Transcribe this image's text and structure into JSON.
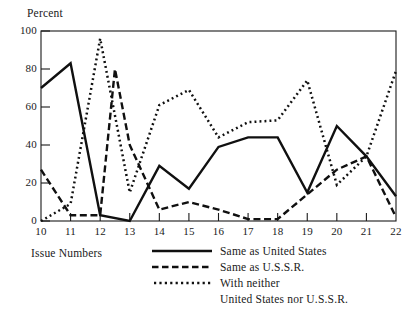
{
  "chart_data": {
    "type": "line",
    "title": "",
    "subtitle": "",
    "xlabel": "Issue Numbers",
    "ylabel": "Percent",
    "xlim": [
      10,
      22
    ],
    "ylim": [
      0,
      100
    ],
    "grid": false,
    "legend_position": "bottom",
    "x_tick_labels": [
      "10",
      "11",
      "12",
      "13",
      "14",
      "15",
      "16",
      "17",
      "18",
      "19",
      "20",
      "21",
      "22"
    ],
    "y_tick_labels": [
      "0",
      "20",
      "40",
      "60",
      "80",
      "100"
    ],
    "x": [
      10,
      11,
      12,
      13,
      14,
      15,
      16,
      17,
      18,
      19,
      20,
      21,
      22
    ],
    "series": [
      {
        "name": "Same as United States",
        "style": "solid",
        "color": "#101010",
        "x": [
          10,
          11,
          12,
          13,
          14,
          15,
          16,
          17,
          18,
          19,
          20,
          21,
          22
        ],
        "values": [
          70,
          83,
          3,
          0,
          29,
          17,
          39,
          44,
          44,
          15,
          50,
          34,
          13
        ]
      },
      {
        "name": "Same as U.S.S.R.",
        "style": "dashed",
        "color": "#101010",
        "x": [
          10,
          11,
          12,
          12.5,
          13,
          14,
          15,
          16,
          17,
          18,
          19,
          20,
          21,
          22
        ],
        "values": [
          27,
          3,
          3,
          80,
          40,
          6,
          10,
          6,
          1,
          1,
          14,
          27,
          34,
          2
        ]
      },
      {
        "name": "With neither United States nor U.S.S.R.",
        "style": "dotted",
        "color": "#101010",
        "x": [
          10,
          11,
          12,
          13,
          14,
          15,
          16,
          17,
          18,
          19,
          20,
          21,
          22
        ],
        "values": [
          0,
          9,
          96,
          15,
          61,
          69,
          44,
          52,
          53,
          74,
          19,
          34,
          79
        ]
      }
    ],
    "legend_entries": [
      {
        "label": "Same as United States",
        "style": "solid"
      },
      {
        "label": "Same as U.S.S.R.",
        "style": "dashed"
      },
      {
        "label": "With neither",
        "style": "dotted"
      },
      {
        "label": "United States nor U.S.S.R.",
        "style": "none"
      }
    ]
  },
  "axes": {
    "y_title": "Percent",
    "x_title": "Issue Numbers",
    "y_ticks": [
      "100",
      "80",
      "60",
      "40",
      "20",
      "0"
    ],
    "x_ticks": [
      "10",
      "11",
      "12",
      "13",
      "14",
      "15",
      "16",
      "17",
      "18",
      "19",
      "20",
      "21",
      "22"
    ]
  },
  "legend": {
    "row1": "Same as United States",
    "row2": "Same as U.S.S.R.",
    "row3": "With neither",
    "row4": "United States nor U.S.S.R."
  }
}
